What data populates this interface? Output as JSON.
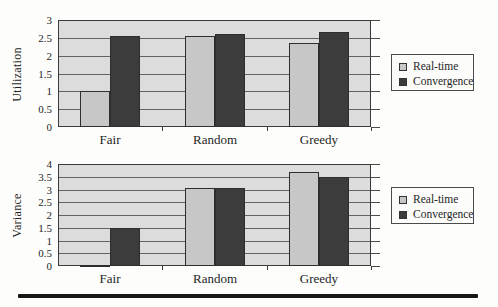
{
  "figure": {
    "kind": "scanned-book-figure",
    "background": "#fdfdfb"
  },
  "colors": {
    "plot_background": "#dcdcdc",
    "real_time_bar": "#c7c7c7",
    "convergence_bar": "#3c3c3c",
    "gridline": "#4d4d4d",
    "axis_border": "#3a3a3a",
    "text": "#1f1f1f",
    "bottom_rule": "#161616"
  },
  "legend": {
    "items": [
      {
        "label": "Real-time",
        "color": "#c7c7c7"
      },
      {
        "label": "Convergence",
        "color": "#3c3c3c"
      }
    ]
  },
  "chart_data": [
    {
      "type": "bar",
      "title": "",
      "xlabel": "",
      "ylabel": "Utilization",
      "categories": [
        "Fair",
        "Random",
        "Greedy"
      ],
      "series": [
        {
          "name": "Real-time",
          "values": [
            1.0,
            2.55,
            2.35
          ]
        },
        {
          "name": "Convergence",
          "values": [
            2.55,
            2.6,
            2.65
          ]
        }
      ],
      "ylim": [
        0,
        3
      ],
      "ytick_step": 0.5,
      "ytick_labels": [
        "0",
        "0.5",
        "1",
        "1.5",
        "2",
        "2.5",
        "3"
      ],
      "grid": true,
      "legend_position": "right"
    },
    {
      "type": "bar",
      "title": "",
      "xlabel": "",
      "ylabel": "Variance",
      "categories": [
        "Fair",
        "Random",
        "Greedy"
      ],
      "series": [
        {
          "name": "Real-time",
          "values": [
            0.05,
            3.05,
            3.7
          ]
        },
        {
          "name": "Convergence",
          "values": [
            1.5,
            3.05,
            3.5
          ]
        }
      ],
      "ylim": [
        0,
        4
      ],
      "ytick_step": 0.5,
      "ytick_labels": [
        "0",
        "0.5",
        "1",
        "1.5",
        "2",
        "2.5",
        "3",
        "3.5",
        "4"
      ],
      "grid": true,
      "legend_position": "right"
    }
  ]
}
